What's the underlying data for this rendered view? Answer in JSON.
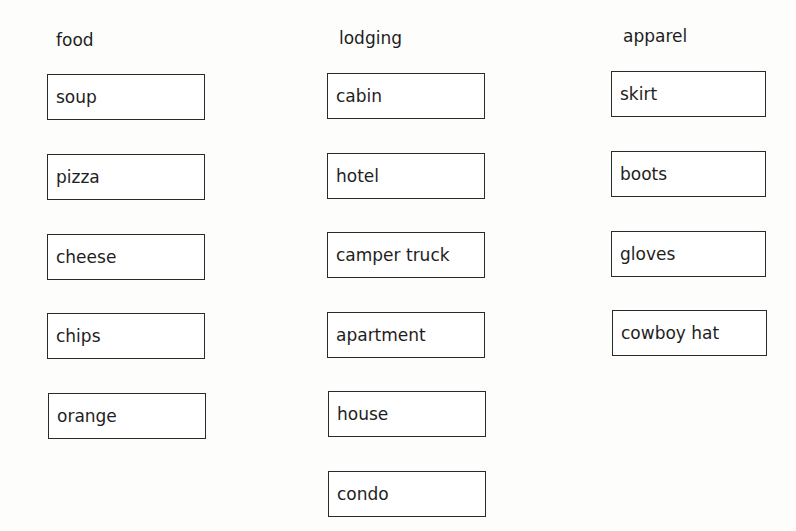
{
  "columns": [
    {
      "header": "food",
      "items": [
        "soup",
        "pizza",
        "cheese",
        "chips",
        "orange"
      ]
    },
    {
      "header": "lodging",
      "items": [
        "cabin",
        "hotel",
        "camper truck",
        "apartment",
        "house",
        "condo"
      ]
    },
    {
      "header": "apparel",
      "items": [
        "skirt",
        "boots",
        "gloves",
        "cowboy hat"
      ]
    }
  ]
}
